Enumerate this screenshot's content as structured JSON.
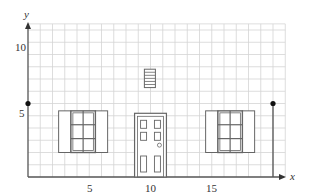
{
  "axes": {
    "x_label": "x",
    "y_label": "y",
    "x_ticks": [
      {
        "value": 5,
        "label": "5"
      },
      {
        "value": 10,
        "label": "10"
      },
      {
        "value": 15,
        "label": "15"
      }
    ],
    "y_ticks": [
      {
        "value": 5,
        "label": "5"
      },
      {
        "value": 10,
        "label": "10"
      }
    ],
    "x_range": [
      0,
      21
    ],
    "y_range": [
      0,
      12.5
    ]
  },
  "colors": {
    "grid": "#d4d4d4",
    "axis": "#555555",
    "outline": "#666666",
    "point": "#111111"
  },
  "house": {
    "left_wall": {
      "x": 0,
      "y_top": 6
    },
    "right_wall": {
      "x": 20,
      "y_top": 6
    },
    "windows": [
      {
        "name": "left-window",
        "x": 3,
        "y": 2,
        "w": 4,
        "h": 4
      },
      {
        "name": "right-window",
        "x": 15,
        "y": 2,
        "w": 4,
        "h": 4
      }
    ],
    "door": {
      "x": 8.7,
      "y": 0,
      "w": 2.6,
      "h": 5.2
    },
    "vent": {
      "x": 9.5,
      "y": 7.3,
      "w": 0.9,
      "h": 1.5
    }
  }
}
